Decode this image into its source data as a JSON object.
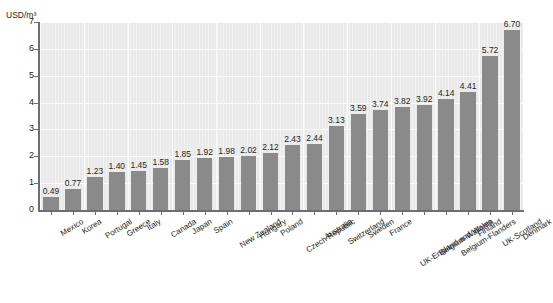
{
  "chart": {
    "title": "",
    "y_axis_unit": "USD/m³"
  },
  "chart_data": {
    "type": "bar",
    "title": "",
    "subtitle": "",
    "xlabel": "",
    "ylabel": "USD/m³",
    "ylim": [
      0,
      7
    ],
    "ytick_labels": [
      "0",
      "1",
      "2",
      "3",
      "4",
      "5",
      "6",
      "7"
    ],
    "ytick_values": [
      0,
      1,
      2,
      3,
      4,
      5,
      6,
      7
    ],
    "grid": true,
    "legend": false,
    "bar_color": "#8a8a8a",
    "plot_background": "#e9e9e9",
    "gridline_color": "#ffffff",
    "categories": [
      "Mexico",
      "Korea",
      "Portugal",
      "Greece",
      "Italy",
      "Canada",
      "Japan",
      "Spain",
      "New Zealand",
      "Hungary",
      "Poland",
      "Czech Republic",
      "Australia",
      "Switzerland",
      "Sweden",
      "France",
      "UK-England and Wales",
      "Belgium-Wallonia",
      "Belgium-Flanders",
      "Finland",
      "UK-Scotland",
      "Denmark"
    ],
    "values": [
      0.49,
      0.77,
      1.23,
      1.4,
      1.45,
      1.58,
      1.85,
      1.92,
      1.98,
      2.02,
      2.12,
      2.43,
      2.44,
      3.13,
      3.59,
      3.74,
      3.82,
      3.92,
      4.14,
      4.41,
      5.72,
      6.7
    ],
    "value_labels": [
      "0.49",
      "0.77",
      "1.23",
      "1.40",
      "1.45",
      "1.58",
      "1.85",
      "1.92",
      "1.98",
      "2.02",
      "2.12",
      "2.43",
      "2.44",
      "3.13",
      "3.59",
      "3.74",
      "3.82",
      "3.92",
      "4.14",
      "4.41",
      "5.72",
      "6.70"
    ]
  }
}
